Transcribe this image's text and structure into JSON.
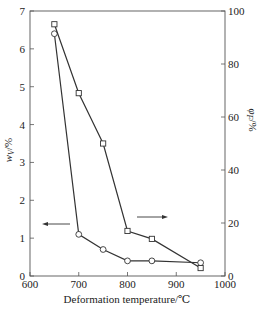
{
  "chart_data": {
    "type": "line",
    "title": "",
    "xlabel": "Deformation temperature/℃",
    "ylabel": "w_V/%",
    "ylabel_right": "φ_F/%",
    "xlim": [
      600,
      1000
    ],
    "ylim": [
      0,
      7
    ],
    "ylim_right": [
      0,
      100
    ],
    "x_ticks": [
      600,
      700,
      800,
      900,
      1000
    ],
    "y_ticks": [
      0,
      1,
      2,
      3,
      4,
      5,
      6,
      7
    ],
    "y_ticks_right": [
      0,
      20,
      40,
      60,
      80,
      100
    ],
    "grid": false,
    "legend": "none (arrows indicate axis)",
    "series": [
      {
        "name": "w_V (left axis)",
        "marker": "circle",
        "axis": "left",
        "x": [
          650,
          700,
          750,
          800,
          850,
          950
        ],
        "values": [
          6.4,
          1.1,
          0.7,
          0.4,
          0.4,
          0.35
        ]
      },
      {
        "name": "φ_F (right axis)",
        "marker": "square",
        "axis": "right",
        "x": [
          650,
          700,
          750,
          800,
          850,
          950
        ],
        "values": [
          95,
          69,
          50,
          17,
          14,
          3
        ]
      }
    ],
    "annotations": [
      {
        "type": "arrow",
        "direction": "left",
        "refers_to": "w_V (left axis)"
      },
      {
        "type": "arrow",
        "direction": "right",
        "refers_to": "φ_F (right axis)"
      }
    ]
  },
  "labels": {
    "xlabel": "Deformation temperature/℃",
    "ylabel_main": "w",
    "ylabel_sub": "V",
    "ylabel_unit": "/%",
    "ylabel_right_main": "φ",
    "ylabel_right_sub": "F",
    "ylabel_right_unit": "/%"
  }
}
